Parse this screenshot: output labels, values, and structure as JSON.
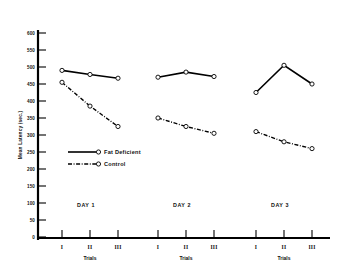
{
  "chart_data": {
    "type": "line",
    "title": "",
    "xlabel": "Trials",
    "ylabel": "Mean Latency (sec.)",
    "ylim": [
      0,
      600
    ],
    "ytick_labels": [
      "600",
      "550",
      "500",
      "450",
      "400",
      "350",
      "300",
      "250",
      "200",
      "150",
      "100",
      "50",
      "0"
    ],
    "ytick_values": [
      600,
      550,
      500,
      450,
      400,
      350,
      300,
      250,
      200,
      150,
      100,
      50,
      0
    ],
    "grid": false,
    "legend_position": "center-left",
    "groups": [
      {
        "name": "DAY 1",
        "trials": [
          "I",
          "II",
          "III"
        ],
        "axis_label": "Trials"
      },
      {
        "name": "DAY 2",
        "trials": [
          "I",
          "II",
          "III"
        ],
        "axis_label": "Trials"
      },
      {
        "name": "DAY 3",
        "trials": [
          "I",
          "II",
          "III"
        ],
        "axis_label": "Trials"
      }
    ],
    "categories": [
      "I",
      "II",
      "III",
      "I",
      "II",
      "III",
      "I",
      "II",
      "III"
    ],
    "series": [
      {
        "name": "Fat Deficient",
        "line_style": "solid",
        "marker": "open-circle",
        "color": "#000000",
        "values": [
          490,
          478,
          467,
          470,
          485,
          472,
          425,
          505,
          450
        ]
      },
      {
        "name": "Control",
        "line_style": "dash-dot",
        "marker": "open-circle",
        "color": "#000000",
        "values": [
          455,
          385,
          325,
          350,
          325,
          305,
          310,
          280,
          260
        ]
      }
    ]
  },
  "legend": {
    "entries": [
      {
        "label": "Fat Deficient"
      },
      {
        "label": "Control"
      }
    ]
  },
  "axes": {
    "y_axis_title": "Mean Latency (sec.)"
  }
}
